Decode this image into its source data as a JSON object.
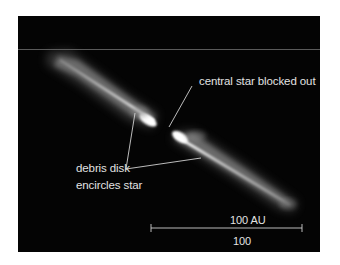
{
  "figure": {
    "background_color": "#040404",
    "page_color": "#ffffff",
    "annotations": {
      "central_star": "central star blocked out",
      "debris_disk_line1": "debris disk",
      "debris_disk_line2": "encircles star"
    },
    "scale_bar": {
      "label_top": "100 AU",
      "label_bottom": "100",
      "color": "#cfcfcf"
    },
    "label_color": "#e2e2e2"
  }
}
